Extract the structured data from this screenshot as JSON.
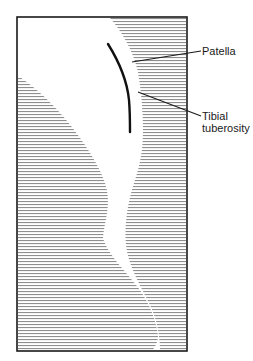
{
  "diagram": {
    "type": "anatomical-illustration",
    "frame": {
      "x": 16,
      "y": 16,
      "width": 171,
      "height": 335,
      "border_color": "#1a1a1a"
    },
    "hatch": {
      "style": "horizontal-lines",
      "line_color": "#8a8a8a",
      "spacing_px": 3
    },
    "labels": {
      "patella": "Patella",
      "tibial_line1": "Tibial",
      "tibial_line2": "tuberosity"
    },
    "leader_lines": [
      {
        "label": "Patella",
        "from": [
          132,
          62
        ],
        "to": [
          201,
          51
        ]
      },
      {
        "label": "Tibial tuberosity",
        "from": [
          138,
          92
        ],
        "to": [
          201,
          116
        ]
      }
    ],
    "patella_curve": {
      "start": [
        108,
        44
      ],
      "end": [
        130,
        132
      ],
      "stroke_color": "#111111"
    }
  }
}
